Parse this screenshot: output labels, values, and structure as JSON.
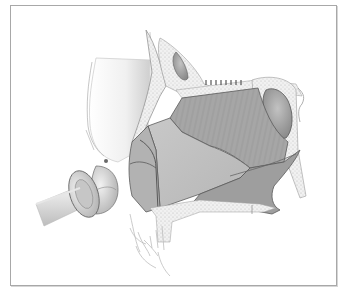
{
  "figure": {
    "type": "anatomical-illustration",
    "style": "grayscale pencil rendering",
    "colors": {
      "background": "#ffffff",
      "frame_border": "#a8a8a8",
      "tissue_dark": "#8c8c8c",
      "tissue_mid": "#b4b4b4",
      "tissue_light": "#dadada",
      "outline": "#5a5a5a",
      "bone_stipple": "#e8e8e8"
    },
    "regions": [
      "nasal-bone-soft-tissue",
      "frontal-sinus",
      "cribriform-plate",
      "sphenoid-sinus",
      "septal-cartilage",
      "perpendicular-plate",
      "vomer",
      "maxillary-crest",
      "upper-teeth",
      "instrument"
    ]
  }
}
